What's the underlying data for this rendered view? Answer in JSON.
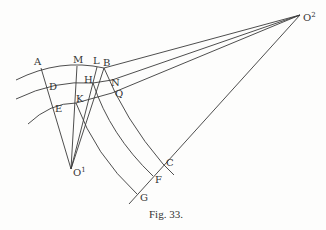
{
  "figure": {
    "caption": "Fig. 33.",
    "points": {
      "A": "A",
      "M": "M",
      "L": "L",
      "B": "B",
      "D": "D",
      "H": "H",
      "N": "N",
      "Q": "Q",
      "E": "E",
      "K": "K",
      "O1": "O",
      "O1_sup": "1",
      "O2": "O",
      "O2_sup": "2",
      "C": "C",
      "F": "F",
      "G": "G"
    },
    "line_color": "#3a3a3a"
  }
}
